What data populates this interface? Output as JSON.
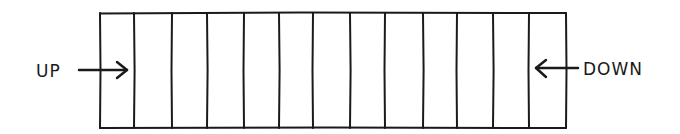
{
  "diagram": {
    "type": "horizontal-segmented-bar",
    "stroke_color": "#1a1a1a",
    "background": "#ffffff",
    "box": {
      "left": 100,
      "top": 13,
      "right": 566,
      "bottom": 128
    },
    "divider_x": [
      134,
      172,
      207,
      244,
      279,
      313,
      350,
      385,
      423,
      457,
      493,
      529
    ],
    "cell_count": 13,
    "labels": {
      "left": {
        "text": "UP",
        "arrow_direction": "right"
      },
      "right": {
        "text": "DOWN",
        "arrow_direction": "left"
      }
    }
  }
}
